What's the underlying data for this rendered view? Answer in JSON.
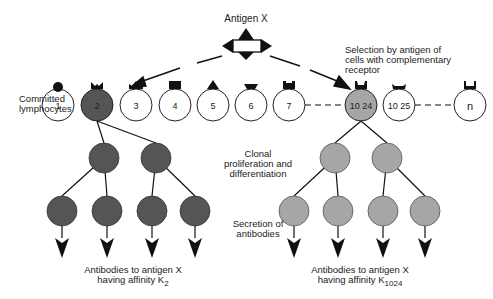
{
  "antigen": {
    "label": "Antigen X"
  },
  "labels": {
    "committed": "Committed lymphocytes",
    "committed_line1": "Committed",
    "committed_line2": "lymphocytes",
    "selection_line1": "Selection by antigen of",
    "selection_line2": "cells with complementary",
    "selection_line3": "receptor",
    "clonal_line1": "Clonal",
    "clonal_line2": "proliferation and",
    "clonal_line3": "differentiation",
    "secretion_line1": "Secretion of",
    "secretion_line2": "antibodies",
    "left_result_line1": "Antibodies to antigen X",
    "left_result_line2": "having affinity K",
    "left_result_sub": "2",
    "right_result_line1": "Antibodies to antigen X",
    "right_result_line2": "having affinity K",
    "right_result_sub": "1024"
  },
  "cells": [
    {
      "label": "1",
      "receptor": "round",
      "selected": false
    },
    {
      "label": "2",
      "receptor": "v-notch",
      "selected": true
    },
    {
      "label": "3",
      "receptor": "crown",
      "selected": false
    },
    {
      "label": "4",
      "receptor": "square",
      "selected": false
    },
    {
      "label": "5",
      "receptor": "triangle",
      "selected": false
    },
    {
      "label": "6",
      "receptor": "trapezoid",
      "selected": false
    },
    {
      "label": "7",
      "receptor": "notched-square",
      "selected": false
    },
    {
      "label": "10 24",
      "receptor": "u-notch",
      "selected": true
    },
    {
      "label": "10 25",
      "receptor": "trapezoid-concave",
      "selected": false
    },
    {
      "label": "n",
      "receptor": "u-notch-open",
      "selected": false
    }
  ],
  "colors": {
    "clone_left": "#555555",
    "clone_right": "#a6a6a6",
    "cell_outline": "#222222",
    "line": "#111111"
  }
}
